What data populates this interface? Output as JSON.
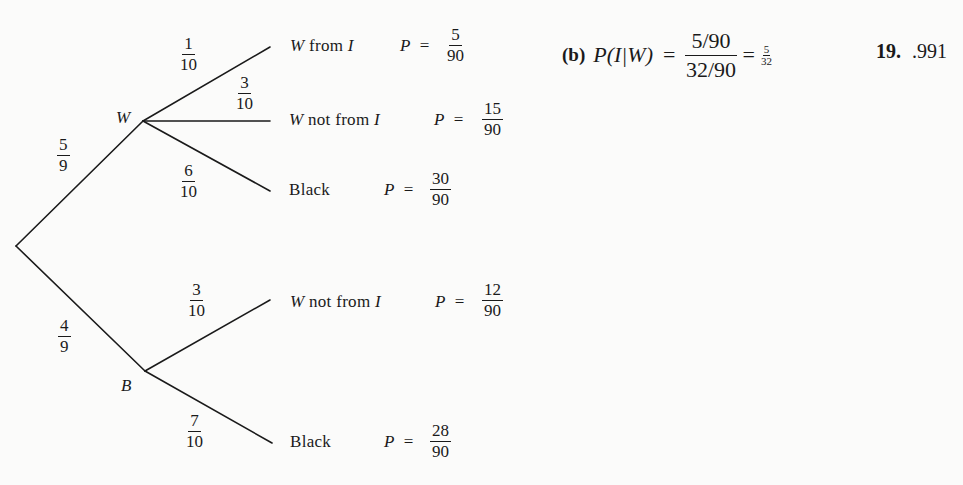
{
  "tree": {
    "root_node": "",
    "level1": [
      {
        "node": "W",
        "prob_num": "5",
        "prob_den": "9"
      },
      {
        "node": "B",
        "prob_num": "4",
        "prob_den": "9"
      }
    ],
    "outcomes": [
      {
        "branch_num": "1",
        "branch_den": "10",
        "label_italic": "W",
        "label_rest": " from ",
        "label_italic2": "I",
        "p_label": "P",
        "eq": "=",
        "p_num": "5",
        "p_den": "90"
      },
      {
        "branch_num": "3",
        "branch_den": "10",
        "label_italic": "W",
        "label_rest": " not from ",
        "label_italic2": "I",
        "p_label": "P",
        "eq": "=",
        "p_num": "15",
        "p_den": "90"
      },
      {
        "branch_num": "6",
        "branch_den": "10",
        "label_italic": "",
        "label_rest": "Black",
        "label_italic2": "",
        "p_label": "P",
        "eq": "=",
        "p_num": "30",
        "p_den": "90"
      },
      {
        "branch_num": "3",
        "branch_den": "10",
        "label_italic": "W",
        "label_rest": " not from ",
        "label_italic2": "I",
        "p_label": "P",
        "eq": "=",
        "p_num": "12",
        "p_den": "90"
      },
      {
        "branch_num": "7",
        "branch_den": "10",
        "label_italic": "",
        "label_rest": "Black",
        "label_italic2": "",
        "p_label": "P",
        "eq": "=",
        "p_num": "28",
        "p_den": "90"
      }
    ]
  },
  "answer_b": {
    "part_label": "(b)",
    "lhs": "P(I|W)",
    "eq1": "=",
    "frac_num": "5/90",
    "frac_den": "32/90",
    "eq2": "=",
    "result_num": "5",
    "result_den": "32"
  },
  "answer_19": {
    "number": "19.",
    "value": ".991"
  },
  "colors": {
    "background": "#fbfbfa",
    "ink": "#1a1a1a"
  }
}
